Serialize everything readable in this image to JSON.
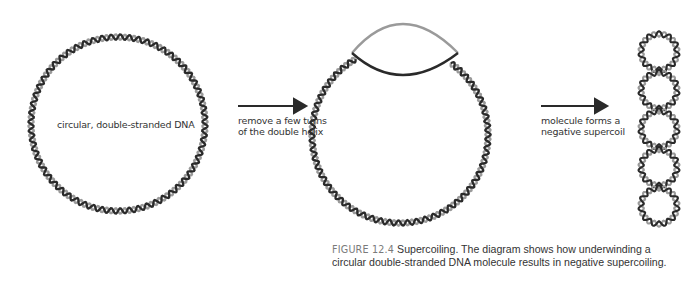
{
  "diagram": {
    "title": "Supercoiling",
    "colors": {
      "strand_dark": "#2a2a2a",
      "strand_light": "#9a9a9a",
      "arrow": "#2a2a2a",
      "text": "#333333",
      "figure_label": "#7a7a7a"
    },
    "stages": [
      {
        "id": "relaxed",
        "label": "circular, double-stranded DNA"
      },
      {
        "id": "underwound",
        "label": ""
      },
      {
        "id": "supercoiled",
        "label": ""
      }
    ],
    "arrows": [
      {
        "label_line1": "remove a few turns",
        "label_line2": "of the double helix"
      },
      {
        "label_line1": "molecule forms a",
        "label_line2": "negative supercoil"
      }
    ]
  },
  "caption": {
    "figure_label": "FIGURE 12.4",
    "text": " Supercoiling. The diagram shows how underwinding a circular double-stranded DNA molecule results in negative supercoiling."
  }
}
